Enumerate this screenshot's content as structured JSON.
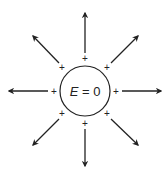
{
  "diagram": {
    "center_label": "E = 0",
    "center_label_var": "E",
    "center_label_rest": " = 0",
    "charge_symbol": "+",
    "colors": {
      "stroke": "#222222",
      "background": "#ffffff"
    },
    "circle": {
      "cx": 85,
      "cy": 91,
      "r": 25
    },
    "field_lines": [
      {
        "direction": "up"
      },
      {
        "direction": "up-right"
      },
      {
        "direction": "right"
      },
      {
        "direction": "down-right"
      },
      {
        "direction": "down"
      },
      {
        "direction": "down-left"
      },
      {
        "direction": "left"
      },
      {
        "direction": "up-left"
      }
    ]
  }
}
